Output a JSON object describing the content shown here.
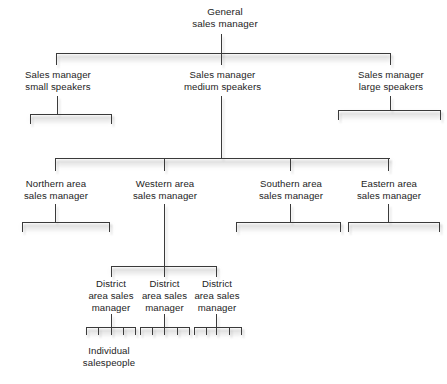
{
  "diagram": {
    "type": "organization-chart",
    "levels": 5,
    "line_color": "#3a3a3a",
    "text_color": "#1d1d1d",
    "background_color": "#ffffff"
  },
  "nodes": {
    "root": {
      "label": "General\nsales manager",
      "level": 1
    },
    "level2": [
      {
        "label": "Sales manager\nsmall speakers"
      },
      {
        "label": "Sales manager\nmedium speakers"
      },
      {
        "label": "Sales manager\nlarge speakers"
      }
    ],
    "level3": [
      {
        "label": "Northern area\nsales manager"
      },
      {
        "label": "Western area\nsales manager"
      },
      {
        "label": "Southern area\nsales manager"
      },
      {
        "label": "Eastern area\nsales manager"
      }
    ],
    "level4": [
      {
        "label": "District\narea sales\nmanager"
      },
      {
        "label": "District\narea sales\nmanager"
      },
      {
        "label": "District\narea sales\nmanager"
      }
    ],
    "level5": {
      "label": "Individual\nsalespeople",
      "groups": 3,
      "members_per_group": 5
    }
  }
}
